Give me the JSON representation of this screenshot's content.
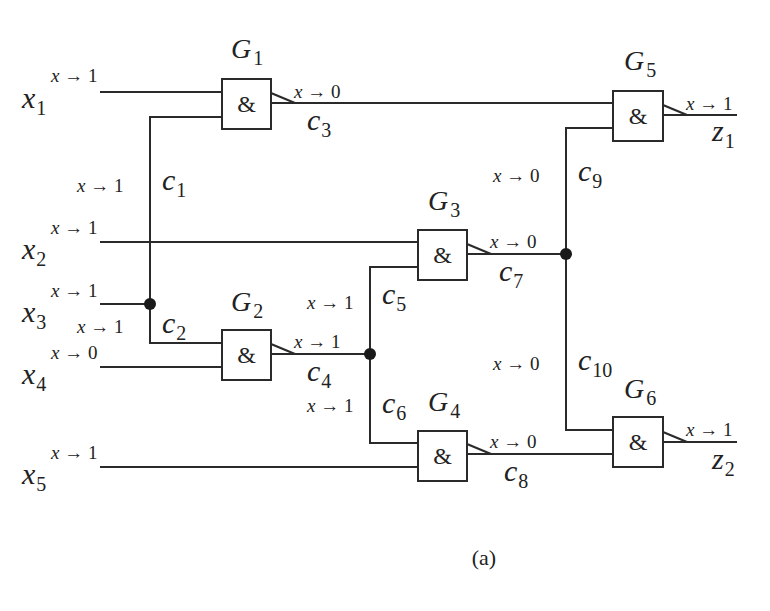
{
  "caption": "(a)",
  "symbols": {
    "and_gate": "&",
    "arrow": "→",
    "fault_var": "x"
  },
  "inputs": [
    {
      "id": "x1",
      "base": "x",
      "sub": "1",
      "annotation": "1"
    },
    {
      "id": "x2",
      "base": "x",
      "sub": "2",
      "annotation": "1"
    },
    {
      "id": "x3",
      "base": "x",
      "sub": "3",
      "annotation": "1"
    },
    {
      "id": "x4",
      "base": "x",
      "sub": "4",
      "annotation": "0"
    },
    {
      "id": "x5",
      "base": "x",
      "sub": "5",
      "annotation": "1"
    }
  ],
  "outputs": [
    {
      "id": "z1",
      "base": "z",
      "sub": "1",
      "annotation": "1"
    },
    {
      "id": "z2",
      "base": "z",
      "sub": "2",
      "annotation": "1"
    }
  ],
  "gates": [
    {
      "id": "G1",
      "base": "G",
      "sub": "1",
      "type": "&",
      "inputs": [
        "x1",
        "c1"
      ],
      "output": "c3"
    },
    {
      "id": "G2",
      "base": "G",
      "sub": "2",
      "type": "&",
      "inputs": [
        "c2",
        "x4"
      ],
      "output": "c4"
    },
    {
      "id": "G3",
      "base": "G",
      "sub": "3",
      "type": "&",
      "inputs": [
        "x2",
        "c5"
      ],
      "output": "c7"
    },
    {
      "id": "G4",
      "base": "G",
      "sub": "4",
      "type": "&",
      "inputs": [
        "c6",
        "x5"
      ],
      "output": "c8"
    },
    {
      "id": "G5",
      "base": "G",
      "sub": "5",
      "type": "&",
      "inputs": [
        "c3",
        "c9"
      ],
      "output": "z1"
    },
    {
      "id": "G6",
      "base": "G",
      "sub": "6",
      "type": "&",
      "inputs": [
        "c10",
        "c8"
      ],
      "output": "z2"
    }
  ],
  "connections": [
    {
      "id": "c1",
      "base": "c",
      "sub": "1",
      "annotation": "1"
    },
    {
      "id": "c2",
      "base": "c",
      "sub": "2",
      "annotation": "1"
    },
    {
      "id": "c3",
      "base": "c",
      "sub": "3",
      "annotation": "0"
    },
    {
      "id": "c4",
      "base": "c",
      "sub": "4",
      "annotation": "1"
    },
    {
      "id": "c5",
      "base": "c",
      "sub": "5",
      "annotation": "1"
    },
    {
      "id": "c6",
      "base": "c",
      "sub": "6",
      "annotation": "1"
    },
    {
      "id": "c7",
      "base": "c",
      "sub": "7",
      "annotation": "0"
    },
    {
      "id": "c8",
      "base": "c",
      "sub": "8",
      "annotation": "0"
    },
    {
      "id": "c9",
      "base": "c",
      "sub": "9",
      "annotation": "0"
    },
    {
      "id": "c10",
      "base": "c",
      "sub": "10",
      "annotation": "0"
    }
  ],
  "colors": {
    "line": "#2a2a2a",
    "background": "#ffffff"
  }
}
